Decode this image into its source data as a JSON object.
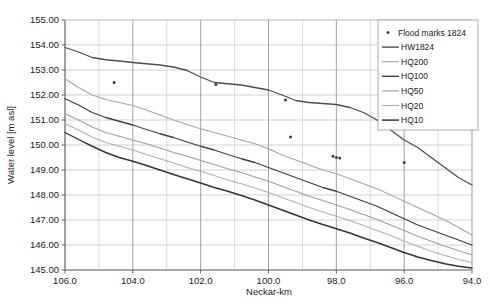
{
  "chart_data": {
    "type": "line",
    "title": "",
    "xlabel": "Neckar-km",
    "ylabel": "Water level [m asl]",
    "xlim": [
      106.0,
      94.0
    ],
    "ylim": [
      145.0,
      155.0
    ],
    "x_reversed": true,
    "grid": true,
    "x_ticks": [
      "106.0",
      "104.0",
      "102.0",
      "100.0",
      "98.0",
      "96.0",
      "94.0"
    ],
    "x_tick_values": [
      106.0,
      104.0,
      102.0,
      100.0,
      98.0,
      96.0,
      94.0
    ],
    "x_minor_step": 1.0,
    "y_ticks": [
      "145.00",
      "146.00",
      "147.00",
      "148.00",
      "149.00",
      "150.00",
      "151.00",
      "152.00",
      "153.00",
      "154.00",
      "155.00"
    ],
    "y_tick_values": [
      145.0,
      146.0,
      147.0,
      148.0,
      149.0,
      150.0,
      151.0,
      152.0,
      153.0,
      154.0,
      155.0
    ],
    "legend_position": "top-right",
    "series": [
      {
        "name": "HW1824",
        "type": "line",
        "color": "#4d4d4d",
        "width": 1.3,
        "x": [
          106.0,
          105.6,
          105.2,
          104.8,
          104.4,
          104.0,
          103.6,
          103.2,
          102.8,
          102.4,
          102.0,
          101.6,
          101.2,
          100.8,
          100.4,
          100.0,
          99.6,
          99.2,
          98.8,
          98.4,
          98.0,
          97.6,
          97.2,
          96.8,
          96.4,
          96.0,
          95.6,
          95.2,
          94.8,
          94.4,
          94.0
        ],
        "values": [
          153.9,
          153.72,
          153.5,
          153.41,
          153.36,
          153.3,
          153.25,
          153.2,
          153.12,
          152.98,
          152.72,
          152.5,
          152.45,
          152.4,
          152.3,
          152.2,
          152.0,
          151.78,
          151.7,
          151.66,
          151.62,
          151.5,
          151.3,
          151.0,
          150.6,
          150.2,
          149.9,
          149.5,
          149.1,
          148.7,
          148.4
        ]
      },
      {
        "name": "HQ200",
        "type": "line",
        "color": "#a6a6a6",
        "width": 1.1,
        "x": [
          106.0,
          105.6,
          105.2,
          104.8,
          104.4,
          104.0,
          103.6,
          103.2,
          102.8,
          102.4,
          102.0,
          101.6,
          101.2,
          100.8,
          100.4,
          100.0,
          99.6,
          99.2,
          98.8,
          98.4,
          98.0,
          97.6,
          97.2,
          96.8,
          96.4,
          96.0,
          95.6,
          95.2,
          94.8,
          94.4,
          94.0
        ],
        "values": [
          152.65,
          152.3,
          152.0,
          151.82,
          151.7,
          151.58,
          151.4,
          151.2,
          151.0,
          150.82,
          150.65,
          150.5,
          150.35,
          150.2,
          150.05,
          149.85,
          149.6,
          149.4,
          149.2,
          149.0,
          148.85,
          148.65,
          148.45,
          148.25,
          148.0,
          147.75,
          147.5,
          147.25,
          147.0,
          146.7,
          146.4
        ]
      },
      {
        "name": "HQ100",
        "type": "line",
        "color": "#404040",
        "width": 1.3,
        "x": [
          106.0,
          105.6,
          105.2,
          104.8,
          104.4,
          104.0,
          103.6,
          103.2,
          102.8,
          102.4,
          102.0,
          101.6,
          101.2,
          100.8,
          100.4,
          100.0,
          99.6,
          99.2,
          98.8,
          98.4,
          98.0,
          97.6,
          97.2,
          96.8,
          96.4,
          96.0,
          95.6,
          95.2,
          94.8,
          94.4,
          94.0
        ],
        "values": [
          151.85,
          151.6,
          151.3,
          151.1,
          150.95,
          150.8,
          150.62,
          150.45,
          150.3,
          150.12,
          149.95,
          149.8,
          149.62,
          149.45,
          149.3,
          149.1,
          148.9,
          148.7,
          148.5,
          148.3,
          148.15,
          147.95,
          147.75,
          147.55,
          147.3,
          147.05,
          146.8,
          146.6,
          146.4,
          146.2,
          146.0
        ]
      },
      {
        "name": "HQ50",
        "type": "line",
        "color": "#9e9e9e",
        "width": 1.1,
        "x": [
          106.0,
          105.6,
          105.2,
          104.8,
          104.4,
          104.0,
          103.6,
          103.2,
          102.8,
          102.4,
          102.0,
          101.6,
          101.2,
          100.8,
          100.4,
          100.0,
          99.6,
          99.2,
          98.8,
          98.4,
          98.0,
          97.6,
          97.2,
          96.8,
          96.4,
          96.0,
          95.6,
          95.2,
          94.8,
          94.4,
          94.0
        ],
        "values": [
          151.25,
          151.0,
          150.72,
          150.5,
          150.35,
          150.2,
          150.05,
          149.88,
          149.7,
          149.55,
          149.38,
          149.22,
          149.05,
          148.9,
          148.72,
          148.55,
          148.35,
          148.15,
          147.95,
          147.78,
          147.6,
          147.42,
          147.22,
          147.02,
          146.8,
          146.58,
          146.35,
          146.15,
          145.95,
          145.78,
          145.6
        ]
      },
      {
        "name": "HQ20",
        "type": "line",
        "color": "#b0b0b0",
        "width": 1.1,
        "x": [
          106.0,
          105.6,
          105.2,
          104.8,
          104.4,
          104.0,
          103.6,
          103.2,
          102.8,
          102.4,
          102.0,
          101.6,
          101.2,
          100.8,
          100.4,
          100.0,
          99.6,
          99.2,
          98.8,
          98.4,
          98.0,
          97.6,
          97.2,
          96.8,
          96.4,
          96.0,
          95.6,
          95.2,
          94.8,
          94.4,
          94.0
        ],
        "values": [
          150.85,
          150.6,
          150.32,
          150.1,
          149.95,
          149.8,
          149.62,
          149.45,
          149.28,
          149.1,
          148.95,
          148.78,
          148.6,
          148.45,
          148.28,
          148.1,
          147.9,
          147.7,
          147.5,
          147.32,
          147.15,
          146.98,
          146.78,
          146.58,
          146.38,
          146.15,
          145.95,
          145.75,
          145.58,
          145.42,
          145.3
        ]
      },
      {
        "name": "HQ10",
        "type": "line",
        "color": "#333333",
        "width": 1.4,
        "x": [
          106.0,
          105.6,
          105.2,
          104.8,
          104.4,
          104.0,
          103.6,
          103.2,
          102.8,
          102.4,
          102.0,
          101.6,
          101.2,
          100.8,
          100.4,
          100.0,
          99.6,
          99.2,
          98.8,
          98.4,
          98.0,
          97.6,
          97.2,
          96.8,
          96.4,
          96.0,
          95.6,
          95.2,
          94.8,
          94.4,
          94.0
        ],
        "values": [
          150.5,
          150.22,
          149.95,
          149.7,
          149.5,
          149.35,
          149.18,
          149.0,
          148.82,
          148.65,
          148.48,
          148.3,
          148.15,
          147.98,
          147.8,
          147.6,
          147.4,
          147.2,
          147.0,
          146.82,
          146.65,
          146.48,
          146.28,
          146.1,
          145.9,
          145.7,
          145.52,
          145.38,
          145.25,
          145.15,
          145.08
        ]
      }
    ],
    "scatter": {
      "name": "Flood marks 1824",
      "color": "#404040",
      "marker": "dot",
      "points": [
        {
          "x": 104.55,
          "y": 152.5
        },
        {
          "x": 101.55,
          "y": 152.42
        },
        {
          "x": 99.5,
          "y": 151.8
        },
        {
          "x": 99.35,
          "y": 150.32
        },
        {
          "x": 98.1,
          "y": 149.55
        },
        {
          "x": 98.0,
          "y": 149.5
        },
        {
          "x": 97.9,
          "y": 149.48
        },
        {
          "x": 96.0,
          "y": 149.3
        }
      ]
    },
    "legend": [
      {
        "label": "Flood marks 1824",
        "type": "marker",
        "color": "#404040"
      },
      {
        "label": "HW1824",
        "type": "line",
        "color": "#4d4d4d",
        "width": 1.4
      },
      {
        "label": "HQ200",
        "type": "line",
        "color": "#a6a6a6",
        "width": 1.1
      },
      {
        "label": "HQ100",
        "type": "line",
        "color": "#404040",
        "width": 1.4
      },
      {
        "label": "HQ50",
        "type": "line",
        "color": "#9e9e9e",
        "width": 1.1
      },
      {
        "label": "HQ20",
        "type": "line",
        "color": "#b0b0b0",
        "width": 1.1
      },
      {
        "label": "HQ10",
        "type": "line",
        "color": "#333333",
        "width": 1.5
      }
    ]
  }
}
